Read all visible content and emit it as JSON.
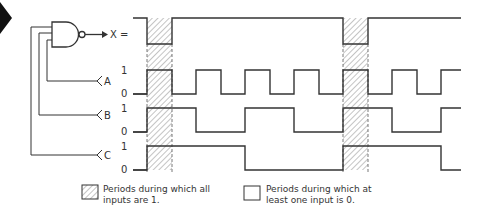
{
  "gate": {
    "type": "NAND",
    "output_label": "X =",
    "inputs": [
      "A",
      "B",
      "C"
    ]
  },
  "signals": [
    {
      "name": "X",
      "high_label": "",
      "low_label": "",
      "y_high": 18,
      "y_low": 44,
      "start": 1,
      "transitions": [
        147,
        172,
        343,
        368
      ]
    },
    {
      "name": "A",
      "high_label": "1",
      "low_label": "0",
      "y_high": 70,
      "y_low": 94,
      "start": 0,
      "transitions": [
        147,
        172,
        196,
        221,
        245,
        270,
        294,
        319,
        343,
        368,
        392,
        417,
        441
      ]
    },
    {
      "name": "B",
      "high_label": "1",
      "low_label": "0",
      "y_high": 108,
      "y_low": 132,
      "start": 0,
      "transitions": [
        147,
        196,
        245,
        294,
        343,
        392,
        441
      ]
    },
    {
      "name": "C",
      "high_label": "1",
      "low_label": "0",
      "y_high": 146,
      "y_low": 170,
      "start": 0,
      "transitions": [
        147,
        245,
        343,
        441
      ]
    }
  ],
  "waveform": {
    "x_start": 133,
    "x_end": 461
  },
  "hatched_periods": [
    [
      147,
      172
    ],
    [
      343,
      368
    ]
  ],
  "labels": {
    "A": "A",
    "B": "B",
    "C": "C",
    "one": "1",
    "zero": "0"
  },
  "legend": {
    "hatched": {
      "line1": "Periods during which all",
      "line2": "inputs are 1."
    },
    "blank": {
      "line1": "Periods during which at",
      "line2": "least one input is 0."
    }
  },
  "colors": {
    "ink": "#333333",
    "hatch": "#8a8a8a",
    "background": "#ffffff"
  }
}
